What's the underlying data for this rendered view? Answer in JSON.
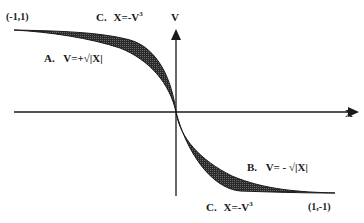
{
  "diagram": {
    "axes": {
      "x_label": "X",
      "v_label": "V"
    },
    "points": {
      "top_left": "(-1,1)",
      "bottom_right": "(1,-1)"
    },
    "curves": {
      "a_label": "A.",
      "a_eq": "V=+√|X|",
      "b_label": "B.",
      "b_eq": "V= - √|X|",
      "c_top_label": "C.",
      "c_top_eq": "X=-V",
      "c_bottom_label": "C.",
      "c_bottom_eq": "X=-V",
      "c_exponent": "3"
    },
    "colors": {
      "ink": "#1a1a1a",
      "fill": "#3a3a3a"
    }
  }
}
